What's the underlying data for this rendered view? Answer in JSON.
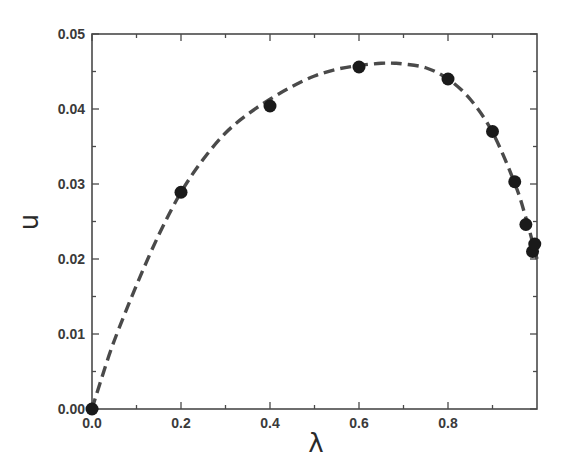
{
  "chart_data": {
    "type": "scatter",
    "title": "",
    "xlabel": "λ",
    "ylabel": "u",
    "xlim": [
      0.0,
      1.0
    ],
    "ylim": [
      0.0,
      0.05
    ],
    "grid": false,
    "legend": null,
    "x_ticks": [
      0.0,
      0.2,
      0.4,
      0.6,
      0.8
    ],
    "x_tick_labels": [
      "0.0",
      "0.2",
      "0.4",
      "0.6",
      "0.8"
    ],
    "x_minor_ticks": [
      0.1,
      0.3,
      0.5,
      0.7,
      0.9
    ],
    "y_ticks": [
      0.0,
      0.01,
      0.02,
      0.03,
      0.04,
      0.05
    ],
    "y_tick_labels": [
      "0.00",
      "0.01",
      "0.02",
      "0.03",
      "0.04",
      "0.05"
    ],
    "y_minor_ticks": [
      0.005,
      0.015,
      0.025,
      0.035,
      0.045
    ],
    "series": [
      {
        "name": "data points",
        "style": "filled-circle",
        "color": "#1a1a1a",
        "x": [
          0.0,
          0.2,
          0.4,
          0.6,
          0.8,
          0.9,
          0.95,
          0.975,
          0.99,
          0.995
        ],
        "y": [
          0.0,
          0.0289,
          0.0404,
          0.0456,
          0.044,
          0.037,
          0.0303,
          0.0246,
          0.021,
          0.022
        ]
      },
      {
        "name": "fit curve",
        "style": "dashed-line",
        "color": "#4a4a4a",
        "x": [
          0.0,
          0.02,
          0.05,
          0.1,
          0.15,
          0.2,
          0.25,
          0.3,
          0.35,
          0.4,
          0.45,
          0.5,
          0.55,
          0.6,
          0.65,
          0.68,
          0.7,
          0.75,
          0.8,
          0.85,
          0.9,
          0.95,
          0.975,
          1.0
        ],
        "y": [
          0.0,
          0.0038,
          0.0091,
          0.0165,
          0.0232,
          0.0289,
          0.0333,
          0.0368,
          0.0393,
          0.0413,
          0.043,
          0.0444,
          0.0453,
          0.0458,
          0.0461,
          0.0461,
          0.046,
          0.0455,
          0.044,
          0.0413,
          0.0369,
          0.0301,
          0.0255,
          0.02
        ]
      }
    ]
  }
}
